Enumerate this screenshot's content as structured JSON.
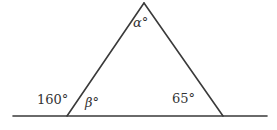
{
  "diagram": {
    "type": "geometry",
    "labels": {
      "apex_angle": "α°",
      "left_interior_angle": "β°",
      "left_exterior_angle": "160°",
      "right_interior_angle": "65°"
    },
    "values": {
      "exterior_angle_deg": 160,
      "right_interior_angle_deg": 65
    },
    "colors": {
      "stroke": "#3a3a3a",
      "text": "#333333",
      "background": "#ffffff"
    }
  }
}
